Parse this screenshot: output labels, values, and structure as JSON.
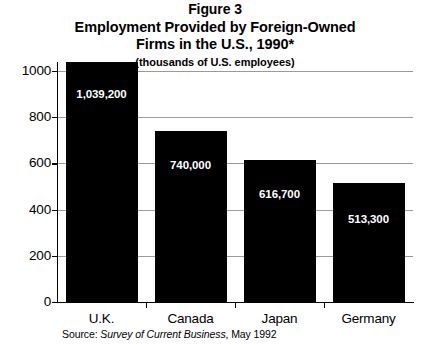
{
  "title": {
    "line1": "Figure 3",
    "line2": "Employment Provided by Foreign-Owned",
    "line3": "Firms in the U.S., 1990*",
    "subtitle": "(thousands of U.S. employees)"
  },
  "source": {
    "prefix": "Source:",
    "publication": "Survey of Current Business",
    "suffix": ", May 1992"
  },
  "chart_data": {
    "type": "bar",
    "subtitle": "(thousands of U.S. employees)",
    "xlabel": "",
    "ylabel": "",
    "categories": [
      "U.K.",
      "Canada",
      "Japan",
      "Germany"
    ],
    "values": [
      1039.2,
      740.0,
      616.7,
      513.3
    ],
    "data_labels": [
      "1,039,200",
      "740,000",
      "616,700",
      "513,300"
    ],
    "ylim": [
      0,
      1000
    ],
    "yticks": [
      0,
      200,
      400,
      600,
      800,
      1000
    ],
    "ytick_labels": [
      "0",
      "200",
      "400",
      "600",
      "800",
      "1000"
    ],
    "grid": true,
    "legend": false,
    "bar_color": "#000000",
    "label_color": "#FFFFFF",
    "grid_color": "#9A9A9A",
    "axis_color": "#000000",
    "background": "#FFFFFF"
  }
}
